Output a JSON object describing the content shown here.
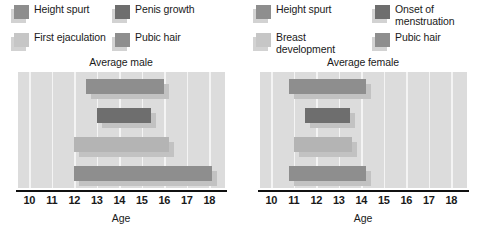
{
  "chart_data": [
    {
      "type": "bar",
      "orientation": "horizontal",
      "title": "Average male",
      "xlabel": "Age",
      "ylabel": "",
      "xlim": [
        9.5,
        18.7
      ],
      "xticks": [
        10,
        11,
        12,
        13,
        14,
        15,
        16,
        17,
        18
      ],
      "grid": true,
      "legend_position": "top",
      "categories": [
        "Height spurt",
        "Penis growth",
        "First ejaculation",
        "Pubic hair"
      ],
      "series": [
        {
          "name": "Height spurt",
          "start": 12.5,
          "end": 16.0,
          "color": "#8e8e8e"
        },
        {
          "name": "Penis growth",
          "start": 13.0,
          "end": 15.4,
          "color": "#6e6e6e"
        },
        {
          "name": "First ejaculation",
          "start": 12.0,
          "end": 16.2,
          "color": "#b4b4b4"
        },
        {
          "name": "Pubic hair",
          "start": 12.0,
          "end": 18.1,
          "color": "#8e8e8e"
        }
      ]
    },
    {
      "type": "bar",
      "orientation": "horizontal",
      "title": "Average female",
      "xlabel": "Age",
      "ylabel": "",
      "xlim": [
        9.5,
        18.7
      ],
      "xticks": [
        10,
        11,
        12,
        13,
        14,
        15,
        16,
        17,
        18
      ],
      "grid": true,
      "legend_position": "top",
      "categories": [
        "Height spurt",
        "Onset of\nmenstruation",
        "Breast development",
        "Pubic hair"
      ],
      "series": [
        {
          "name": "Height spurt",
          "start": 10.8,
          "end": 14.2,
          "color": "#8e8e8e"
        },
        {
          "name": "Onset of menstruation",
          "start": 11.5,
          "end": 13.5,
          "color": "#6e6e6e"
        },
        {
          "name": "Breast development",
          "start": 11.0,
          "end": 13.6,
          "color": "#b4b4b4"
        },
        {
          "name": "Pubic hair",
          "start": 10.8,
          "end": 14.2,
          "color": "#8e8e8e"
        }
      ]
    }
  ],
  "panels": [
    {
      "id": "male",
      "title": "Average male",
      "axis_label": "Age",
      "ticks": [
        "10",
        "11",
        "12",
        "13",
        "14",
        "15",
        "16",
        "17",
        "18"
      ],
      "legend": [
        {
          "label": "Height spurt",
          "color": "#8e8e8e"
        },
        {
          "label": "First ejaculation",
          "color": "#c6c6c6"
        },
        {
          "label": "Penis growth",
          "color": "#6e6e6e"
        },
        {
          "label": "Pubic hair",
          "color": "#8e8e8e"
        }
      ]
    },
    {
      "id": "female",
      "title": "Average female",
      "axis_label": "Age",
      "ticks": [
        "10",
        "11",
        "12",
        "13",
        "14",
        "15",
        "16",
        "17",
        "18"
      ],
      "legend": [
        {
          "label": "Height spurt",
          "color": "#8e8e8e"
        },
        {
          "label": "Breast development",
          "color": "#c6c6c6"
        },
        {
          "label": "Onset of\nmenstruation",
          "color": "#6e6e6e"
        },
        {
          "label": "Pubic hair",
          "color": "#8e8e8e"
        }
      ]
    }
  ],
  "colors": {
    "plot_background": "#dcdcdc",
    "gridline": "#f4f4f4",
    "axis": "#111111",
    "bar_shadow": "#c2c2c2",
    "dark": "#6e6e6e",
    "medium": "#8e8e8e",
    "light": "#b4b4b4"
  }
}
